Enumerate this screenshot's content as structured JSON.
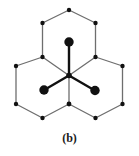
{
  "figure": {
    "caption": "(b)",
    "type": "diagram",
    "colors": {
      "background": "#ffffff",
      "edge": "#6e6e6e",
      "edge_dark": "#3a3a3a",
      "vertex": "#111111",
      "vector": "#111111",
      "large_dot": "#111111",
      "caption": "#1a1a1a"
    },
    "geometry": {
      "center": {
        "x": 69,
        "y": 75.5
      },
      "hex_radius": 29,
      "vertex_dot_radius": 2.1,
      "large_dot_radius": 4.6,
      "vector_stroke_width": 2.4,
      "edge_stroke_width": 1.3
    },
    "hexagons": [
      {
        "name": "top-hexagon",
        "cx": 69,
        "cy": 41.5
      },
      {
        "name": "bottom-left-hexagon",
        "cx": 42.5,
        "cy": 87
      },
      {
        "name": "bottom-right-hexagon",
        "cx": 95.5,
        "cy": 87
      }
    ],
    "vertices": [
      {
        "name": "vertex-top-apex",
        "x": 69,
        "y": 10
      },
      {
        "name": "vertex-top-upper-left",
        "x": 42.5,
        "y": 23
      },
      {
        "name": "vertex-top-upper-right",
        "x": 95.5,
        "y": 23
      },
      {
        "name": "vertex-mid-left",
        "x": 42.5,
        "y": 57
      },
      {
        "name": "vertex-mid-right",
        "x": 95.5,
        "y": 57
      },
      {
        "name": "vertex-center",
        "x": 69,
        "y": 75.5
      },
      {
        "name": "vertex-far-left-upper",
        "x": 16,
        "y": 66
      },
      {
        "name": "vertex-far-right-upper",
        "x": 122.5,
        "y": 66
      },
      {
        "name": "vertex-far-left-lower",
        "x": 16,
        "y": 104
      },
      {
        "name": "vertex-far-right-lower",
        "x": 122.5,
        "y": 104
      },
      {
        "name": "vertex-bottom-center",
        "x": 69,
        "y": 104
      },
      {
        "name": "vertex-bottom-left",
        "x": 42.5,
        "y": 118
      },
      {
        "name": "vertex-bottom-right",
        "x": 95.5,
        "y": 118
      }
    ],
    "basis_vectors": [
      {
        "name": "vector-up",
        "x1": 69,
        "y1": 75.5,
        "x2": 69,
        "y2": 42,
        "tip_x": 69,
        "tip_y": 42
      },
      {
        "name": "vector-down-left",
        "x1": 69,
        "y1": 75.5,
        "x2": 44,
        "y2": 90,
        "tip_x": 44,
        "tip_y": 90
      },
      {
        "name": "vector-down-right",
        "x1": 69,
        "y1": 75.5,
        "x2": 95,
        "y2": 90.5,
        "tip_x": 95,
        "tip_y": 90.5
      }
    ],
    "large_dots": [
      {
        "name": "large-dot-up",
        "x": 69,
        "y": 42
      },
      {
        "name": "large-dot-down-left",
        "x": 44,
        "y": 90
      },
      {
        "name": "large-dot-down-right",
        "x": 95,
        "y": 90.5
      }
    ]
  }
}
